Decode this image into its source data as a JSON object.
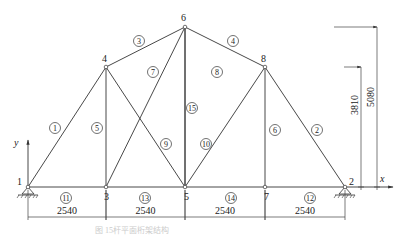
{
  "diagram": {
    "type": "planar truss",
    "nodes": [
      {
        "id": "1",
        "x": 28,
        "y": 187,
        "lx": 17,
        "ly": 185
      },
      {
        "id": "2",
        "x": 345,
        "y": 187,
        "lx": 349,
        "ly": 185
      },
      {
        "id": "3",
        "x": 106,
        "y": 187,
        "lx": 104,
        "ly": 200
      },
      {
        "id": "4",
        "x": 106,
        "y": 67,
        "lx": 102,
        "ly": 62
      },
      {
        "id": "5",
        "x": 185,
        "y": 187,
        "lx": 184,
        "ly": 200
      },
      {
        "id": "6",
        "x": 185,
        "y": 27,
        "lx": 181,
        "ly": 21
      },
      {
        "id": "7",
        "x": 265,
        "y": 187,
        "lx": 264,
        "ly": 200
      },
      {
        "id": "8",
        "x": 265,
        "y": 67,
        "lx": 261,
        "ly": 62
      }
    ],
    "members": [
      {
        "id": "1",
        "from": "1",
        "to": "4",
        "lx": 55,
        "ly": 128
      },
      {
        "id": "2",
        "from": "8",
        "to": "2",
        "lx": 317,
        "ly": 130
      },
      {
        "id": "3",
        "from": "4",
        "to": "6",
        "lx": 139,
        "ly": 41
      },
      {
        "id": "4",
        "from": "6",
        "to": "8",
        "lx": 233,
        "ly": 41
      },
      {
        "id": "5",
        "from": "3",
        "to": "4",
        "lx": 97,
        "ly": 128
      },
      {
        "id": "6",
        "from": "7",
        "to": "8",
        "lx": 275,
        "ly": 130
      },
      {
        "id": "7",
        "from": "5",
        "to": "6",
        "lx": 153,
        "ly": 72
      },
      {
        "id": "8",
        "from": "3",
        "to": "6",
        "lx": 217,
        "ly": 72
      },
      {
        "id": "9",
        "from": "4",
        "to": "5",
        "lx": 166,
        "ly": 144
      },
      {
        "id": "10",
        "from": "8",
        "to": "5",
        "lx": 206,
        "ly": 144
      },
      {
        "id": "11",
        "from": "1",
        "to": "3",
        "lx": 66,
        "ly": 198
      },
      {
        "id": "12",
        "from": "7",
        "to": "2",
        "lx": 310,
        "ly": 198
      },
      {
        "id": "13",
        "from": "3",
        "to": "5",
        "lx": 145,
        "ly": 198
      },
      {
        "id": "14",
        "from": "5",
        "to": "7",
        "lx": 231,
        "ly": 198
      },
      {
        "id": "15",
        "from": "5",
        "to": "6",
        "lx": 192,
        "ly": 108
      }
    ],
    "dimensions": {
      "horizontal": [
        {
          "label": "2540",
          "x1": 28,
          "x2": 106
        },
        {
          "label": "2540",
          "x1": 106,
          "x2": 185
        },
        {
          "label": "2540",
          "x1": 185,
          "x2": 265
        },
        {
          "label": "2540",
          "x1": 265,
          "x2": 345
        }
      ],
      "vertical": [
        {
          "label": "3810",
          "x": 361,
          "ytop": 67
        },
        {
          "label": "5080",
          "x": 377,
          "ytop": 27
        }
      ]
    },
    "axes": {
      "x_label": "x",
      "y_label": "y"
    },
    "caption": "图 15杆平面桁架结构"
  }
}
